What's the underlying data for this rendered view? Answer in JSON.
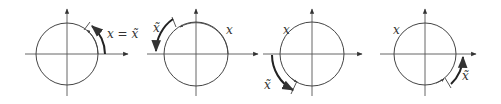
{
  "figure": {
    "panels": [
      {
        "id": "panel-1",
        "center": [
          67,
          54
        ],
        "radius": 31,
        "labels": [
          {
            "text": "x = x̃",
            "role": "angle-label",
            "x": 107,
            "y": 28
          }
        ]
      },
      {
        "id": "panel-2",
        "center": [
          196,
          54
        ],
        "radius": 32,
        "labels": [
          {
            "text": "x̃",
            "role": "reference-angle-label",
            "x": 153,
            "y": 22
          },
          {
            "text": "x",
            "role": "angle-label",
            "x": 226,
            "y": 24
          }
        ]
      },
      {
        "id": "panel-3",
        "center": [
          312,
          54
        ],
        "radius": 32,
        "labels": [
          {
            "text": "x",
            "role": "angle-label",
            "x": 283,
            "y": 24
          },
          {
            "text": "x̃",
            "role": "reference-angle-label",
            "x": 264,
            "y": 79
          }
        ]
      },
      {
        "id": "panel-4",
        "center": [
          425,
          54
        ],
        "radius": 31,
        "labels": [
          {
            "text": "x",
            "role": "angle-label",
            "x": 393,
            "y": 24
          },
          {
            "text": "x̃",
            "role": "reference-angle-label",
            "x": 462,
            "y": 70
          }
        ]
      }
    ]
  }
}
